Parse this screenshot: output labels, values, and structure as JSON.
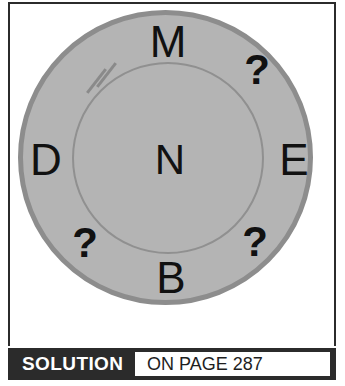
{
  "puzzle": {
    "type": "letter-wheel",
    "outer_ring": {
      "fill_color": "#b4b4b4",
      "stroke_color": "#8d8d8d"
    },
    "inner_circle": {
      "fill_color": "#b4b4b4",
      "stroke_color": "#909090"
    },
    "center": {
      "label": "N"
    },
    "ring_positions": [
      {
        "position": "top",
        "label": "M"
      },
      {
        "position": "top-right",
        "label": "?"
      },
      {
        "position": "right",
        "label": "E"
      },
      {
        "position": "bottom-right",
        "label": "?"
      },
      {
        "position": "bottom",
        "label": "B"
      },
      {
        "position": "bottom-left",
        "label": "?"
      },
      {
        "position": "left",
        "label": "D"
      }
    ],
    "hatch_marks": {
      "count": 2,
      "color": "#8a8a8a",
      "location": "upper-left inner arc"
    }
  },
  "footer": {
    "label": "SOLUTION",
    "page_reference": "ON PAGE 287",
    "bar_color": "#2b2b2b",
    "label_color": "#ffffff",
    "box_color": "#ffffff",
    "page_text_color": "#1e1e1e"
  }
}
